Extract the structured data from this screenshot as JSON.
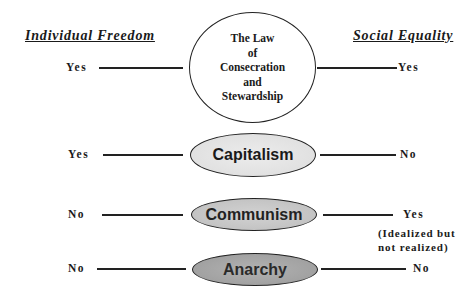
{
  "headers": {
    "left": "Individual Freedom",
    "right": "Social Equality"
  },
  "rows": [
    {
      "name": "The Law of Consecration and Stewardship",
      "lines": [
        "The Law",
        "of",
        "Consecration",
        "and",
        "Stewardship"
      ],
      "freedom": "Yes",
      "equality": "Yes",
      "fill": "#ffffff"
    },
    {
      "name": "Capitalism",
      "freedom": "Yes",
      "equality": "No",
      "fill": "#e6e6e6"
    },
    {
      "name": "Communism",
      "freedom": "No",
      "equality": "Yes",
      "note": [
        "(Idealized but",
        "not realized)"
      ],
      "fill": "#c8c8c8"
    },
    {
      "name": "Anarchy",
      "freedom": "No",
      "equality": "No",
      "fill": "#a8a8a8"
    }
  ]
}
